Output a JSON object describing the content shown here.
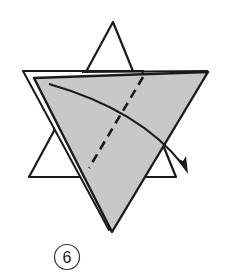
{
  "diagram": {
    "type": "origami-fold-step",
    "step_number": "6",
    "colors": {
      "background": "#ffffff",
      "outline": "#1a1a1a",
      "paper_shaded": "#c8c8c8",
      "paper_white": "#ffffff"
    },
    "elements": {
      "back_triangle": "upward white triangle (star back layer)",
      "front_triangle": "downward gray shaded triangle (front flap)",
      "valley_fold_line": "dashed diagonal fold line",
      "fold_arrow": "curved arrow indicating fold direction to lower right"
    }
  }
}
